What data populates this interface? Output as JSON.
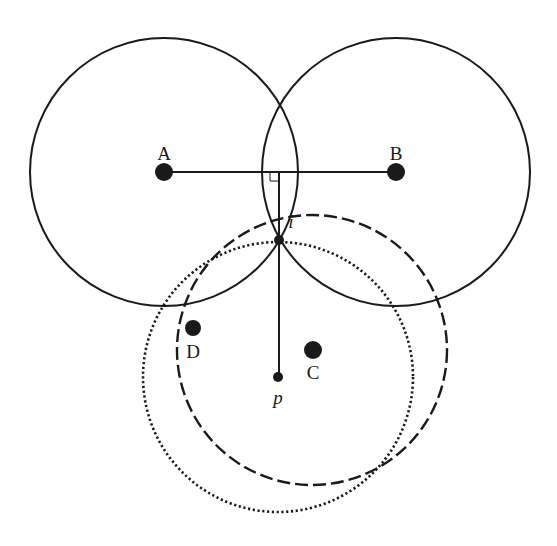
{
  "diagram": {
    "title": "",
    "colors": {
      "stroke": "#1a1a1a",
      "background": "#ffffff"
    },
    "circles": [
      {
        "id": "circle-A",
        "cx": 164,
        "cy": 172,
        "r": 134,
        "style": "solid"
      },
      {
        "id": "circle-B",
        "cx": 396,
        "cy": 172,
        "r": 134,
        "style": "solid"
      },
      {
        "id": "circle-C",
        "cx": 312,
        "cy": 350,
        "r": 135,
        "style": "dashed"
      },
      {
        "id": "circle-D",
        "cx": 278,
        "cy": 377,
        "r": 135,
        "style": "dotted"
      }
    ],
    "points": [
      {
        "id": "A",
        "label": "A",
        "x": 164,
        "y": 172,
        "r": 9,
        "label_x": 164,
        "label_y": 160,
        "italic": false
      },
      {
        "id": "B",
        "label": "B",
        "x": 396,
        "y": 172,
        "r": 9,
        "label_x": 396,
        "label_y": 160,
        "italic": false
      },
      {
        "id": "C",
        "label": "C",
        "x": 313,
        "y": 350,
        "r": 9,
        "label_x": 313,
        "label_y": 379,
        "italic": false
      },
      {
        "id": "D",
        "label": "D",
        "x": 193,
        "y": 328,
        "r": 8,
        "label_x": 193,
        "label_y": 358,
        "italic": false
      },
      {
        "id": "i",
        "label": "i",
        "x": 279,
        "y": 240,
        "r": 5,
        "label_x": 291,
        "label_y": 228,
        "italic": true
      },
      {
        "id": "p",
        "label": "p",
        "x": 278,
        "y": 377,
        "r": 5,
        "label_x": 278,
        "label_y": 404,
        "italic": true
      }
    ],
    "segments": [
      {
        "id": "segment-AB",
        "x1": 164,
        "y1": 172,
        "x2": 396,
        "y2": 172
      },
      {
        "id": "perpendicular",
        "x1": 279,
        "y1": 172,
        "x2": 279,
        "y2": 377
      }
    ],
    "right_angle_marker": {
      "x": 270,
      "y": 172,
      "size": 9
    }
  }
}
